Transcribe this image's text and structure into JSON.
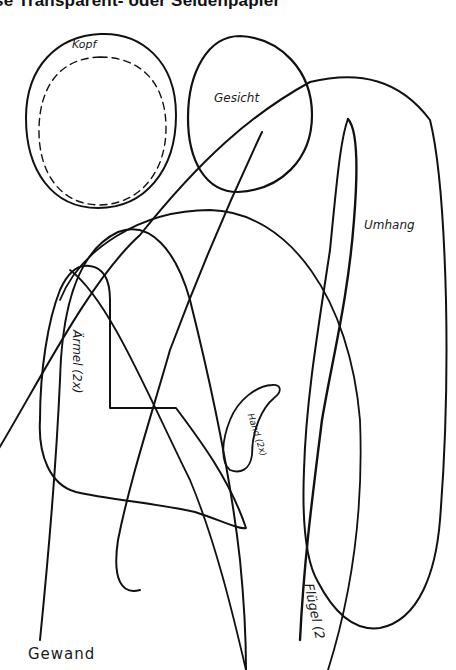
{
  "document": {
    "heading": "se Transparent- oder Seidenpapier",
    "ink_color": "#111111",
    "paper_color": "#ffffff"
  },
  "pattern_pieces": [
    {
      "id": "kopf",
      "label": "Kopf"
    },
    {
      "id": "gesicht",
      "label": "Gesicht"
    },
    {
      "id": "umhang",
      "label": "Umhang"
    },
    {
      "id": "aermel",
      "label": "Ärmel (2x)"
    },
    {
      "id": "hand",
      "label": "Hand (2x)"
    },
    {
      "id": "fluegel",
      "label": "Flügel (2"
    },
    {
      "id": "gewand",
      "label": "Gewand"
    }
  ]
}
